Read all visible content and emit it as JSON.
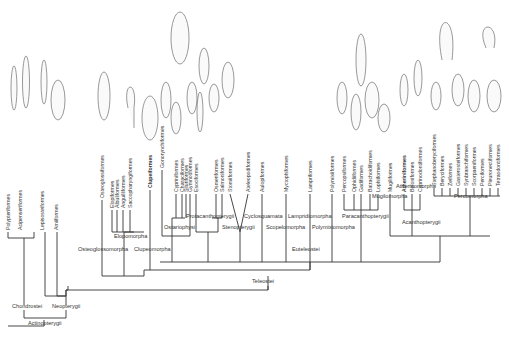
{
  "tree": {
    "root": "Actinopterygii",
    "groups": {
      "chondrostei": "Chondrostei",
      "neopterygii": "Neopterygii",
      "teleostei": "Teleostei",
      "osteoglossomorpha": "Osteoglossomorpha",
      "elopomorpha": "Elopomorpha",
      "clupeomorpha": "Clupeomorpha",
      "euteleostei": "Euteleostei",
      "ostariophysi": "Ostariophysi",
      "protacanthopterygii": "Protacanthopterygii",
      "stenopterygii": "Stenopterygii",
      "cyclosquamata": "Cyclosquamata",
      "scopelomorpha": "Scopelomorpha",
      "lampridiomorpha": "Lampridiomorpha",
      "polymixiomorpha": "Polymixiomorpha",
      "paracanthopterygii": "Paracanthopterygii",
      "acanthopterygii": "Acanthopterygii",
      "mugilomorpha": "Mugilomorpha",
      "atherinomorpha": "Atherinomorpha",
      "percomorpha": "Percomorpha"
    },
    "leaves": [
      "Polypteriformes",
      "Acipenseriformes",
      "Lepisosteiformes",
      "Amiiformes",
      "Osteoglossiformes",
      "Elopiformes",
      "Albuliformes",
      "Anguilliformes",
      "Saccopharyngiformes",
      "Clupeiformes",
      "Gonorynchiformes",
      "Cypriniformes",
      "Characiformes",
      "Siluriformes",
      "Gymnotiformes",
      "Esociformes",
      "Osmeriformes",
      "Salmoniformes",
      "Stomiiformes",
      "Ateleopodiformes",
      "Aulopiformes",
      "Myctophiformes",
      "Lampriformes",
      "Polymixiiformes",
      "Percopsiformes",
      "Ophidiiformes",
      "Gadiformes",
      "Batrachoidiformes",
      "Lophiiformes",
      "Mugiliformes",
      "Atheriniformes",
      "Beloniformes",
      "Cyprinodontiformes",
      "Stephanoberyciformes",
      "Beryciformes",
      "Zeiformes",
      "Gasterosteiformes",
      "Synbranchiformes",
      "Scorpaeniformes",
      "Perciformes",
      "Pleuronectiformes",
      "Tetraodontiformes"
    ]
  }
}
